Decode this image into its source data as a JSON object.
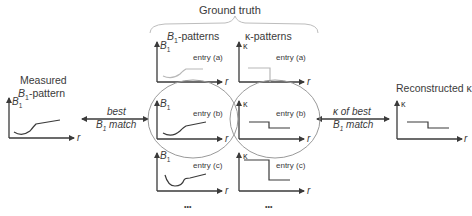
{
  "header": {
    "ground_truth_label": "Ground truth",
    "b1_patterns_label_main": "B",
    "b1_patterns_label_sub": "1",
    "b1_patterns_label_suffix": "-patterns",
    "kappa_patterns_label": "κ-patterns"
  },
  "measured": {
    "title_line1": "Measured",
    "title_line2_main": "B",
    "title_line2_sub": "1",
    "title_line2_suffix": "-pattern",
    "y_axis_main": "B",
    "y_axis_sub": "1",
    "x_axis": "r"
  },
  "left_arrow": {
    "line1": "best",
    "line2_main": "B",
    "line2_sub": "1",
    "line2_suffix": " match"
  },
  "right_arrow": {
    "line1": "κ of best",
    "line2_main": "B",
    "line2_sub": "1",
    "line2_suffix": " match"
  },
  "reconstructed": {
    "title": "Reconstructed κ",
    "y_axis": "κ",
    "x_axis": "r"
  },
  "entries": [
    {
      "label": "entry (a)",
      "highlighted": false
    },
    {
      "label": "entry (b)",
      "highlighted": true
    },
    {
      "label": "entry (c)",
      "highlighted": false
    }
  ],
  "b1_axis": {
    "y_main": "B",
    "y_sub": "1",
    "x": "r"
  },
  "kappa_axis": {
    "y": "κ",
    "x": "r"
  },
  "ellipsis": "•••",
  "colors": {
    "ink": "#3a3a3a",
    "faded_curve": "#b8b8b8",
    "ellipse": "#9a9a9a",
    "brace": "#bdbdbd"
  }
}
